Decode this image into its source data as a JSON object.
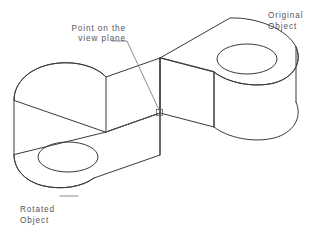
{
  "figure": {
    "background_color": "#ffffff",
    "line_color": "#3a3a3e",
    "text_color": "#55555c",
    "leader_color": "#6e6e76"
  },
  "annotations": {
    "view_plane": {
      "line1": "Point on the",
      "line2": "view plane",
      "align": "right"
    },
    "original": {
      "line1": "Original",
      "line2": "Object",
      "align": "left"
    },
    "rotated": {
      "line1": "Rotated",
      "line2": "Object",
      "align": "left"
    }
  },
  "objects": {
    "original": {
      "name": "Original Object",
      "shape": "extruded-slot-plate",
      "hole": {
        "cx": 247,
        "cy": 78,
        "rx": 30,
        "ry": 15
      },
      "rounded_end": "right"
    },
    "rotated": {
      "name": "Rotated Object",
      "shape": "extruded-slot-plate",
      "hole": {
        "cx": 68,
        "cy": 157,
        "rx": 30,
        "ry": 15
      },
      "rounded_end": "left"
    }
  },
  "markers": {
    "view_plane_point": {
      "x": 160,
      "y": 113
    }
  }
}
